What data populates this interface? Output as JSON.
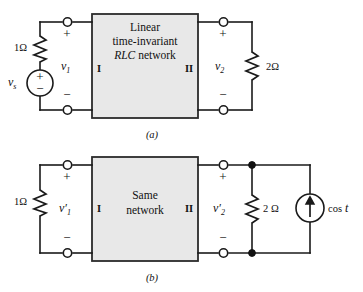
{
  "figure": {
    "title_visible": false,
    "panels": [
      {
        "id": "a",
        "caption": "(a)",
        "network_box": {
          "line1": "Linear",
          "line2": "time-invariant",
          "line3_italic": "RLC",
          "line3_rest": " network",
          "port_left": "I",
          "port_right": "II",
          "fill_color": "#e8e8e8",
          "border_color": "#2b2b2b"
        },
        "source": {
          "name": "voltage-source",
          "label": "v",
          "label_sub": "s",
          "plus": "+",
          "minus": "−"
        },
        "left_resistor": {
          "value": "1",
          "unit": "Ω",
          "label": "1Ω"
        },
        "right_resistor": {
          "value": "2",
          "unit": "Ω",
          "label": "2Ω"
        },
        "left_port_voltage": {
          "label": "v",
          "sub": "1",
          "plus": "+",
          "minus": "−"
        },
        "right_port_voltage": {
          "label": "v",
          "sub": "2",
          "plus": "+",
          "minus": "−"
        }
      },
      {
        "id": "b",
        "caption": "(b)",
        "network_box": {
          "line1": "Same",
          "line2": "network",
          "port_left": "I",
          "port_right": "II",
          "fill_color": "#e8e8e8",
          "border_color": "#2b2b2b"
        },
        "source": {
          "name": "current-source",
          "label_fn": "cos",
          "label_var": "t",
          "direction": "up"
        },
        "left_resistor": {
          "value": "1",
          "unit": "Ω",
          "label": "1Ω"
        },
        "right_resistor": {
          "value": "2",
          "unit": "Ω",
          "label": "2 Ω"
        },
        "left_port_voltage": {
          "label": "v",
          "prime": "′",
          "sub": "1",
          "plus": "+",
          "minus": "−"
        },
        "right_port_voltage": {
          "label": "v",
          "prime": "′",
          "sub": "2",
          "plus": "+",
          "minus": "−"
        }
      }
    ]
  },
  "colors": {
    "wire": "#1a1a1a",
    "box_fill": "#e8e8e8",
    "box_stroke": "#2b2b2b",
    "text": "#111111",
    "background": "#ffffff"
  }
}
